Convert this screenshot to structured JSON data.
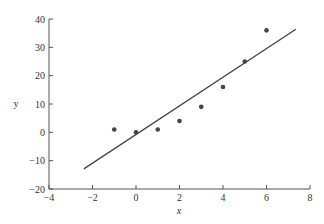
{
  "chart_data": {
    "type": "scatter",
    "title": "",
    "xlabel": "x",
    "ylabel": "y",
    "xlim": [
      -4,
      8
    ],
    "ylim": [
      -20,
      40
    ],
    "grid": false,
    "legend": null,
    "x_ticks": [
      -4,
      -2,
      0,
      2,
      4,
      6,
      8
    ],
    "x_tick_labels": [
      "−4",
      "−2",
      "0",
      "2",
      "4",
      "6",
      "8"
    ],
    "y_ticks": [
      -20,
      -10,
      0,
      10,
      20,
      30,
      40
    ],
    "y_tick_labels": [
      "−20",
      "−10",
      "0",
      "10",
      "20",
      "30",
      "40"
    ],
    "series": [
      {
        "name": "data points",
        "type": "scatter",
        "color": "#444444",
        "x": [
          -1,
          0,
          1,
          2,
          3,
          4,
          5,
          6
        ],
        "y": [
          1,
          0,
          1,
          4,
          9,
          16,
          25,
          36
        ]
      },
      {
        "name": "fitted line",
        "type": "line",
        "color": "#444444",
        "x": [
          -2.4,
          7.35
        ],
        "y": [
          -12.9,
          36.4
        ]
      }
    ]
  }
}
